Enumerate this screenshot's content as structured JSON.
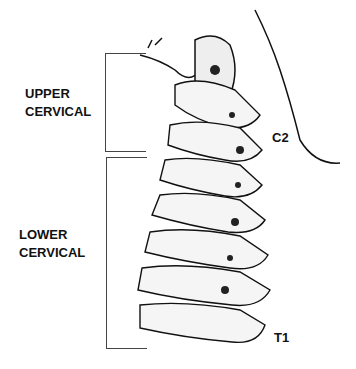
{
  "diagram": {
    "labels": {
      "upper_line1": "UPPER",
      "upper_line2": "CERVICAL",
      "lower_line1": "LOWER",
      "lower_line2": "CERVICAL",
      "c2": "C2",
      "t1": "T1"
    },
    "colors": {
      "ink": "#111111",
      "bracket": "#444444",
      "background": "#ffffff"
    }
  }
}
